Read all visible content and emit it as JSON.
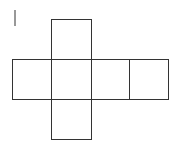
{
  "diagram": {
    "type": "cube-net",
    "stroke_color": "#333333",
    "background": "#ffffff",
    "mark": {
      "x": 15,
      "y1": 10,
      "y2": 26
    },
    "squares": [
      {
        "name": "top",
        "x": 51,
        "y": 19,
        "w": 40,
        "h": 40
      },
      {
        "name": "left",
        "x": 12,
        "y": 59,
        "w": 39,
        "h": 40
      },
      {
        "name": "center",
        "x": 51,
        "y": 59,
        "w": 40,
        "h": 40
      },
      {
        "name": "right",
        "x": 91,
        "y": 59,
        "w": 38,
        "h": 40
      },
      {
        "name": "far-right",
        "x": 129,
        "y": 59,
        "w": 39,
        "h": 40
      },
      {
        "name": "bottom",
        "x": 51,
        "y": 99,
        "w": 40,
        "h": 40
      }
    ]
  }
}
